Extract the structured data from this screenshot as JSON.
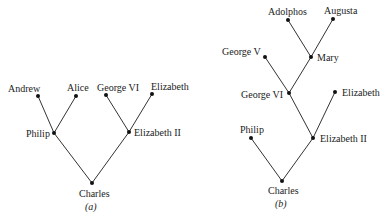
{
  "diagram": {
    "trees": [
      {
        "id": "a",
        "caption": "(a)",
        "nodes": [
          {
            "key": "andrew",
            "label": "Andrew",
            "x": 38,
            "y": 96
          },
          {
            "key": "alice",
            "label": "Alice",
            "x": 76,
            "y": 96
          },
          {
            "key": "george6",
            "label": "George VI",
            "x": 106,
            "y": 95
          },
          {
            "key": "elizabeth",
            "label": "Elizabeth",
            "x": 152,
            "y": 94
          },
          {
            "key": "philip",
            "label": "Philip",
            "x": 54,
            "y": 133
          },
          {
            "key": "elizabeth2",
            "label": "Elizabeth II",
            "x": 129,
            "y": 132
          },
          {
            "key": "charles",
            "label": "Charles",
            "x": 92,
            "y": 183
          }
        ],
        "edges": [
          [
            "andrew",
            "philip"
          ],
          [
            "alice",
            "philip"
          ],
          [
            "george6",
            "elizabeth2"
          ],
          [
            "elizabeth",
            "elizabeth2"
          ],
          [
            "philip",
            "charles"
          ],
          [
            "elizabeth2",
            "charles"
          ]
        ]
      },
      {
        "id": "b",
        "caption": "(b)",
        "nodes": [
          {
            "key": "adolphos",
            "label": "Adolphos",
            "x": 288,
            "y": 20
          },
          {
            "key": "augusta",
            "label": "Augusta",
            "x": 333,
            "y": 19
          },
          {
            "key": "mary",
            "label": "Mary",
            "x": 311,
            "y": 57
          },
          {
            "key": "george5",
            "label": "George V",
            "x": 265,
            "y": 57
          },
          {
            "key": "george6",
            "label": "George VI",
            "x": 289,
            "y": 93
          },
          {
            "key": "elizabeth",
            "label": "Elizabeth",
            "x": 335,
            "y": 92
          },
          {
            "key": "philip",
            "label": "Philip",
            "x": 251,
            "y": 138
          },
          {
            "key": "elizabeth2",
            "label": "Elizabeth II",
            "x": 313,
            "y": 138
          },
          {
            "key": "charles",
            "label": "Charles",
            "x": 282,
            "y": 181
          }
        ],
        "edges": [
          [
            "adolphos",
            "mary"
          ],
          [
            "augusta",
            "mary"
          ],
          [
            "mary",
            "george6"
          ],
          [
            "george5",
            "george6"
          ],
          [
            "george6",
            "elizabeth2"
          ],
          [
            "elizabeth",
            "elizabeth2"
          ],
          [
            "philip",
            "charles"
          ],
          [
            "elizabeth2",
            "charles"
          ]
        ]
      }
    ],
    "colors": {
      "line": "#333333",
      "node": "#111111",
      "text": "#222222"
    }
  }
}
